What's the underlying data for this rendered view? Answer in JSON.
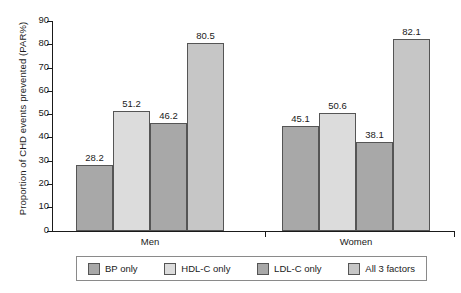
{
  "chart_data": {
    "type": "bar",
    "title": "",
    "xlabel": "",
    "ylabel": "Proportion of CHD events prevented (PAR%)",
    "categories": [
      "Men",
      "Women"
    ],
    "ylim": [
      0,
      90
    ],
    "ytick_step": 10,
    "yticks": [
      "90",
      "80",
      "70",
      "60",
      "50",
      "40",
      "30",
      "20",
      "10",
      "0"
    ],
    "grid": false,
    "legend_position": "bottom",
    "series": [
      {
        "name": "BP only",
        "color": "#a8a8a8",
        "values": [
          28.2,
          45.1
        ]
      },
      {
        "name": "HDL-C only",
        "color": "#dcdcdc",
        "values": [
          51.2,
          50.6
        ]
      },
      {
        "name": "LDL-C only",
        "color": "#a8a8a8",
        "values": [
          46.2,
          38.1
        ]
      },
      {
        "name": "All 3 factors",
        "color": "#c6c6c6",
        "values": [
          80.5,
          82.1
        ]
      }
    ],
    "data_labels": {
      "Men": [
        "28.2",
        "51.2",
        "46.2",
        "80.5"
      ],
      "Women": [
        "45.1",
        "50.6",
        "38.1",
        "82.1"
      ]
    }
  },
  "legend": {
    "items": [
      {
        "label": "BP only"
      },
      {
        "label": "HDL-C only"
      },
      {
        "label": "LDL-C only"
      },
      {
        "label": "All 3 factors"
      }
    ]
  },
  "axis": {
    "y_title": "Proportion of CHD events prevented (PAR%)"
  }
}
